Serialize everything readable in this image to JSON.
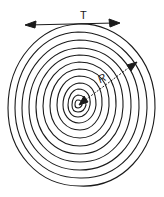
{
  "diagram": {
    "ring_count": 12,
    "labels": {
      "tangential": "T",
      "radial": "R"
    },
    "colors": {
      "ink": "#1a1a1a",
      "background": "#ffffff"
    }
  }
}
